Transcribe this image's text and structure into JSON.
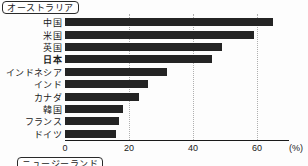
{
  "labels": {
    "top_panel": "オーストラリア",
    "bottom_panel": "ニュージーランド"
  },
  "chart_data": {
    "type": "bar",
    "orientation": "horizontal",
    "title": "",
    "categories": [
      "中国",
      "米国",
      "英国",
      "日本",
      "インドネシア",
      "インド",
      "カナダ",
      "韓国",
      "フランス",
      "ドイツ"
    ],
    "values": [
      65,
      59,
      49,
      46,
      32,
      26,
      23,
      18,
      17,
      16
    ],
    "highlighted_category": "日本",
    "x_ticks": [
      0,
      20,
      40,
      60
    ],
    "xlim": [
      0,
      70
    ],
    "xlabel": "(%)",
    "grid": "vertical-dotted",
    "legend": "none",
    "bar_color": "#242424",
    "gridline_color": "#b0b0b0"
  }
}
